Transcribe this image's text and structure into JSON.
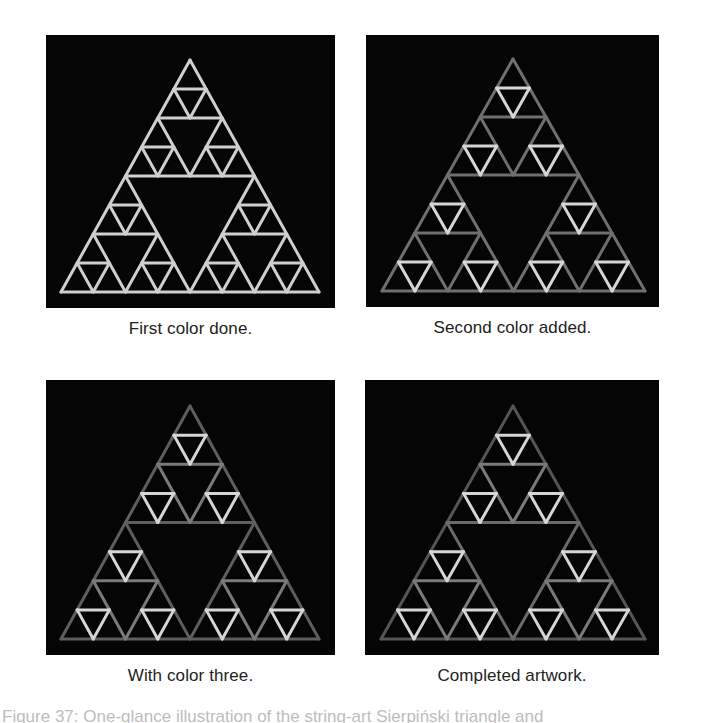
{
  "figure": {
    "caption_partial": "Figure 37: One-glance illustration of the string-art Sierpiński triangle and",
    "panels": [
      {
        "id": "panel-1",
        "caption": "First color done.",
        "box": {
          "left": 46,
          "top": 35,
          "width": 289,
          "height": 273
        },
        "triangle": {
          "apex": [
            144,
            25
          ],
          "left": [
            15,
            257
          ],
          "right": [
            273,
            257
          ]
        },
        "colors": {
          "level0": "#cfcfcf",
          "level1": "#cfcfcf",
          "level2": "#cfcfcf",
          "level3": "#cfcfcf"
        }
      },
      {
        "id": "panel-2",
        "caption": "Second color added.",
        "box": {
          "left": 366,
          "top": 35,
          "width": 293,
          "height": 272
        },
        "triangle": {
          "apex": [
            147,
            24
          ],
          "left": [
            16,
            256
          ],
          "right": [
            279,
            256
          ]
        },
        "colors": {
          "level0": "#6f6f6f",
          "level1": "#6f6f6f",
          "level2": "#6f6f6f",
          "level3": "#d6d6d6"
        }
      },
      {
        "id": "panel-3",
        "caption": "With color three.",
        "box": {
          "left": 46,
          "top": 380,
          "width": 289,
          "height": 275
        },
        "triangle": {
          "apex": [
            144,
            26
          ],
          "left": [
            15,
            259
          ],
          "right": [
            273,
            259
          ]
        },
        "colors": {
          "level0": "#5e5e5e",
          "level1": "#5e5e5e",
          "level2": "#7a7a7a",
          "level3": "#d6d6d6"
        }
      },
      {
        "id": "panel-4",
        "caption": "Completed artwork.",
        "box": {
          "left": 365,
          "top": 380,
          "width": 294,
          "height": 275
        },
        "triangle": {
          "apex": [
            148,
            26
          ],
          "left": [
            16,
            259
          ],
          "right": [
            280,
            259
          ]
        },
        "colors": {
          "level0": "#555555",
          "level1": "#6a6a6a",
          "level2": "#7a7a7a",
          "level3": "#d6d6d6"
        }
      }
    ],
    "stroke_width": 3,
    "background_color": "#050505"
  }
}
